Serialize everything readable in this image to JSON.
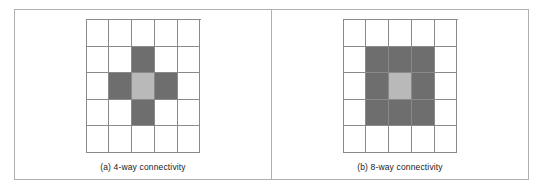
{
  "figure": {
    "colors": {
      "border": "#b0b0b0",
      "grid_line": "#8a8a8a",
      "cell_empty": "#ffffff",
      "cell_dark": "#6e6e6e",
      "cell_light": "#b9b9b9",
      "caption_text": "#1a1a1a"
    }
  },
  "panels": [
    {
      "id": "panel-a",
      "caption": "(a) 4-way connectivity",
      "grid": {
        "rows": 5,
        "cols": 5,
        "cells": [
          [
            "empty",
            "empty",
            "empty",
            "empty",
            "empty"
          ],
          [
            "empty",
            "empty",
            "dark",
            "empty",
            "empty"
          ],
          [
            "empty",
            "dark",
            "light",
            "dark",
            "empty"
          ],
          [
            "empty",
            "empty",
            "dark",
            "empty",
            "empty"
          ],
          [
            "empty",
            "empty",
            "empty",
            "empty",
            "empty"
          ]
        ]
      }
    },
    {
      "id": "panel-b",
      "caption": "(b) 8-way connectivity",
      "grid": {
        "rows": 5,
        "cols": 5,
        "cells": [
          [
            "empty",
            "empty",
            "empty",
            "empty",
            "empty"
          ],
          [
            "empty",
            "dark",
            "dark",
            "dark",
            "empty"
          ],
          [
            "empty",
            "dark",
            "light",
            "dark",
            "empty"
          ],
          [
            "empty",
            "dark",
            "dark",
            "dark",
            "empty"
          ],
          [
            "empty",
            "empty",
            "empty",
            "empty",
            "empty"
          ]
        ]
      }
    }
  ]
}
